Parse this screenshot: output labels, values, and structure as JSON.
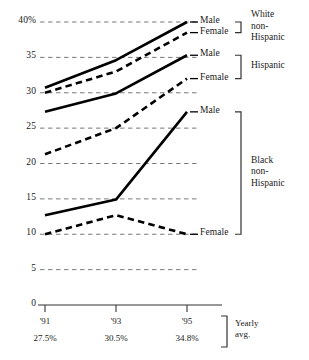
{
  "chart_data": {
    "type": "line",
    "title": "",
    "subtitle": "",
    "xlabel": "",
    "ylabel": "",
    "x": [
      "'91",
      "'93",
      "'95"
    ],
    "categories": [
      "'91",
      "'93",
      "'95"
    ],
    "ylim": [
      0,
      40
    ],
    "ytick_labels": [
      "40%",
      "35",
      "30",
      "25",
      "20",
      "15",
      "10",
      "5",
      "0"
    ],
    "ytick_values": [
      40,
      35,
      30,
      25,
      20,
      15,
      10,
      5,
      0
    ],
    "grid": "horizontal-dashed",
    "legend_position": "right-inline-end-of-line",
    "series": [
      {
        "name": "White non-Hispanic Male",
        "group": "White non-Hispanic",
        "label": "Male",
        "style": "solid",
        "values": [
          30.7,
          34.6,
          40.0
        ]
      },
      {
        "name": "White non-Hispanic Female",
        "group": "White non-Hispanic",
        "label": "Female",
        "style": "dashed",
        "values": [
          30.0,
          33.0,
          38.5
        ]
      },
      {
        "name": "Hispanic Male",
        "group": "Hispanic",
        "label": "Male",
        "style": "solid",
        "values": [
          27.3,
          29.9,
          35.3
        ]
      },
      {
        "name": "Hispanic Female",
        "group": "Hispanic",
        "label": "Female",
        "style": "dashed",
        "values": [
          21.3,
          25.0,
          32.0
        ]
      },
      {
        "name": "Black non-Hispanic Male",
        "group": "Black non-Hispanic",
        "label": "Male",
        "style": "solid",
        "values": [
          12.7,
          14.9,
          27.3
        ]
      },
      {
        "name": "Black non-Hispanic Female",
        "group": "Black non-Hispanic",
        "label": "Female",
        "style": "dashed",
        "values": [
          10.0,
          12.7,
          10.0
        ]
      }
    ],
    "groups": [
      {
        "name": "White non-Hispanic",
        "lines": [
          "White",
          "non-",
          "Hispanic"
        ]
      },
      {
        "name": "Hispanic",
        "lines": [
          "Hispanic"
        ]
      },
      {
        "name": "Black non-Hispanic",
        "lines": [
          "Black",
          "non-",
          "Hispanic"
        ]
      }
    ],
    "yearly_average": {
      "label_lines": [
        "Yearly",
        "avg."
      ],
      "values": [
        "27.5%",
        "30.5%",
        "34.8%"
      ]
    },
    "colors": {
      "line": "#000000",
      "grid": "#6b6b6b",
      "axis": "#333333",
      "text": "#1a1a1a",
      "background": "#ffffff"
    }
  }
}
